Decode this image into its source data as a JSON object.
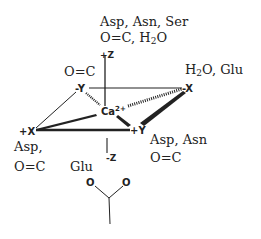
{
  "diagram": {
    "center_ion": {
      "symbol": "Ca",
      "charge": "2+"
    },
    "axes": {
      "plus_z": "+Z",
      "minus_z": "-Z",
      "plus_x": "+X",
      "minus_x": "-X",
      "plus_y": "+Y",
      "minus_y": "-Y"
    },
    "ligand_labels": {
      "top_line1": "Asp, Asn, Ser",
      "top_line2_prefix": "O=C, H",
      "top_line2_sub": "2",
      "top_line2_suffix": "O",
      "minus_y": "O=C",
      "minus_x_prefix": "H",
      "minus_x_sub": "2",
      "minus_x_suffix": "O, Glu",
      "plus_x_line1": "Asp,",
      "plus_x_line2": "O=C",
      "plus_y_line1": "Asp, Asn",
      "plus_y_line2": "O=C",
      "minus_z": "Glu"
    },
    "carboxylate": {
      "oxygen_left": "O",
      "oxygen_right": "O"
    },
    "colors": {
      "ink": "#222222",
      "background": "#ffffff"
    }
  }
}
